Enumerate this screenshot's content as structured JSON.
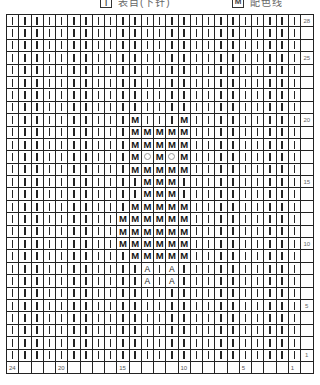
{
  "legend": {
    "items": [
      {
        "symbol": "|",
        "label": "表目(下针)"
      },
      {
        "symbol": "M",
        "label": "配色线"
      }
    ]
  },
  "chart": {
    "columns": 24,
    "rows": 28,
    "column_labels": {
      "24": "24",
      "20": "20",
      "15": "15",
      "10": "10",
      "5": "5",
      "1": "1"
    },
    "row_labels": {
      "28": "28",
      "25": "25",
      "20": "20",
      "15": "15",
      "10": "10",
      "5": "5",
      "1": "1"
    },
    "default_symbol": "knit",
    "symbols": {
      "knit": "|",
      "M": "M",
      "O": "○",
      "A": "A"
    },
    "motif": {
      "20": {
        "14": "M",
        "10": "M"
      },
      "19": {
        "14": "M",
        "13": "M",
        "12": "M",
        "11": "M",
        "10": "M"
      },
      "18": {
        "14": "M",
        "13": "M",
        "12": "M",
        "11": "M",
        "10": "M"
      },
      "17": {
        "14": "M",
        "13": "O",
        "12": "M",
        "11": "O",
        "10": "M"
      },
      "16": {
        "14": "M",
        "13": "M",
        "12": "M",
        "11": "M",
        "10": "M"
      },
      "15": {
        "13": "M",
        "12": "M",
        "11": "M"
      },
      "14": {
        "13": "M",
        "12": "M",
        "11": "M"
      },
      "13": {
        "14": "M",
        "13": "M",
        "12": "M",
        "11": "M",
        "10": "M"
      },
      "12": {
        "15": "M",
        "14": "M",
        "13": "M",
        "12": "M",
        "11": "M",
        "10": "M"
      },
      "11": {
        "15": "M",
        "14": "M",
        "13": "M",
        "12": "M",
        "11": "M",
        "10": "M"
      },
      "10": {
        "15": "M",
        "14": "M",
        "13": "M",
        "12": "M",
        "11": "M",
        "10": "M"
      },
      "9": {
        "14": "M",
        "13": "M",
        "12": "M",
        "11": "M",
        "10": "M"
      },
      "8": {
        "13": "A",
        "11": "A"
      },
      "7": {
        "13": "A",
        "11": "A"
      }
    }
  }
}
